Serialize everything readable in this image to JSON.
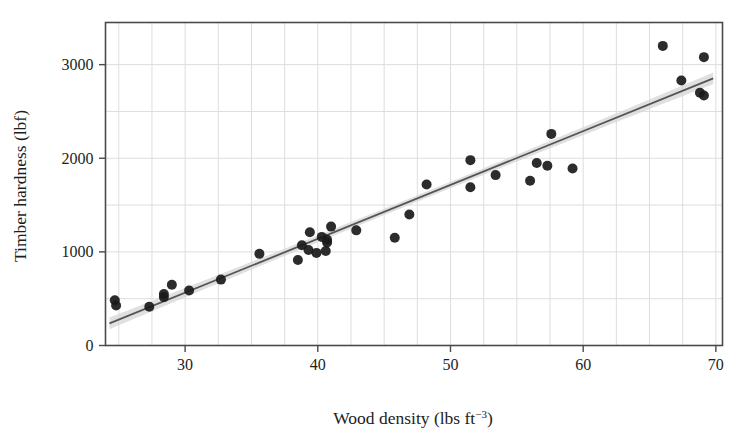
{
  "chart_data": {
    "type": "scatter",
    "title": "",
    "xlabel": "Wood density (lbs ft−3)",
    "xlabel_main": "Wood density (lbs ft",
    "xlabel_sup": "−3",
    "xlabel_tail": ")",
    "ylabel": "Timber hardness (lbf)",
    "xlim": [
      24.0,
      70.5
    ],
    "ylim": [
      0,
      3450
    ],
    "xticks": [
      30,
      40,
      50,
      60,
      70
    ],
    "xtick_labels": [
      "30",
      "40",
      "50",
      "60",
      "70"
    ],
    "yticks": [
      0,
      1000,
      2000,
      3000
    ],
    "ytick_labels": [
      "0",
      "1000",
      "2000",
      "3000"
    ],
    "grid": true,
    "grid_x_step": 2.5,
    "grid_y_step": 500,
    "legend": "none",
    "marker_color": "#1a1a1a",
    "marker_size": 7,
    "line_color": "#555555",
    "band_color": "#d6d6d6",
    "frame_color": "#4a4a4a",
    "grid_color": "#dddddd",
    "fit": {
      "type": "linear",
      "slope": 57.5,
      "intercept": -1160.5,
      "x_start": 24.3,
      "x_end": 69.8,
      "band_halfwidth": 62
    },
    "points": [
      {
        "x": 24.7,
        "y": 484
      },
      {
        "x": 24.8,
        "y": 427
      },
      {
        "x": 27.3,
        "y": 413
      },
      {
        "x": 28.4,
        "y": 517
      },
      {
        "x": 28.4,
        "y": 549
      },
      {
        "x": 29.0,
        "y": 648
      },
      {
        "x": 30.3,
        "y": 587
      },
      {
        "x": 32.7,
        "y": 704
      },
      {
        "x": 35.6,
        "y": 979
      },
      {
        "x": 38.5,
        "y": 914
      },
      {
        "x": 38.8,
        "y": 1070
      },
      {
        "x": 39.3,
        "y": 1020
      },
      {
        "x": 39.4,
        "y": 1210
      },
      {
        "x": 39.9,
        "y": 989
      },
      {
        "x": 40.3,
        "y": 1160
      },
      {
        "x": 40.6,
        "y": 1010
      },
      {
        "x": 40.7,
        "y": 1100
      },
      {
        "x": 40.7,
        "y": 1130
      },
      {
        "x": 41.0,
        "y": 1270
      },
      {
        "x": 42.9,
        "y": 1230
      },
      {
        "x": 45.8,
        "y": 1150
      },
      {
        "x": 46.9,
        "y": 1400
      },
      {
        "x": 48.2,
        "y": 1720
      },
      {
        "x": 51.5,
        "y": 1980
      },
      {
        "x": 51.5,
        "y": 1690
      },
      {
        "x": 53.4,
        "y": 1820
      },
      {
        "x": 56.0,
        "y": 1760
      },
      {
        "x": 56.5,
        "y": 1950
      },
      {
        "x": 57.3,
        "y": 1920
      },
      {
        "x": 57.6,
        "y": 2260
      },
      {
        "x": 59.2,
        "y": 1890
      },
      {
        "x": 66.0,
        "y": 3200
      },
      {
        "x": 67.4,
        "y": 2830
      },
      {
        "x": 68.8,
        "y": 2700
      },
      {
        "x": 69.1,
        "y": 2670
      },
      {
        "x": 69.1,
        "y": 3080
      }
    ]
  }
}
